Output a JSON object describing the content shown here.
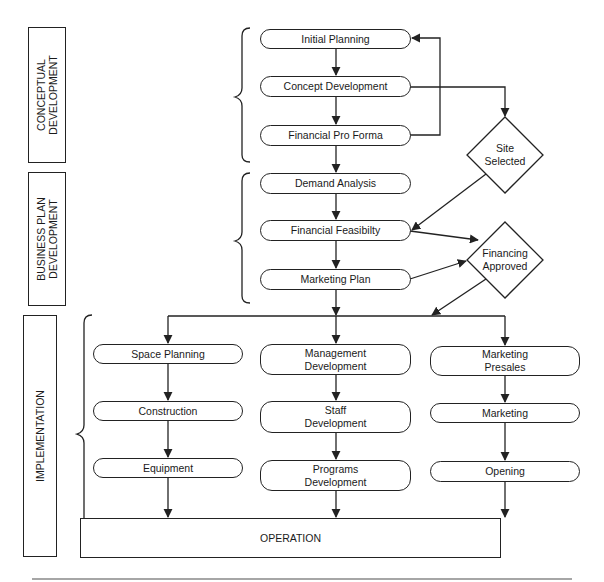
{
  "sections": [
    {
      "id": "conceptual",
      "label": "CONCEPTUAL\nDEVELOPMENT"
    },
    {
      "id": "business",
      "label": "BUSINESS PLAN\nDEVELOPMENT"
    },
    {
      "id": "implementation",
      "label": "IMPLEMENTATION"
    }
  ],
  "conceptual_steps": [
    "Initial Planning",
    "Concept Development",
    "Financial Pro Forma"
  ],
  "business_steps": [
    "Demand Analysis",
    "Financial Feasibilty",
    "Marketing Plan"
  ],
  "decisions": {
    "site": "Site\nSelected",
    "financing": "Financing\nApproved"
  },
  "implementation_columns": [
    {
      "steps": [
        "Space Planning",
        "Construction",
        "Equipment"
      ]
    },
    {
      "steps": [
        "Management\nDevelopment",
        "Staff\nDevelopment",
        "Programs\nDevelopment"
      ]
    },
    {
      "steps": [
        "Marketing\nPresales",
        "Marketing",
        "Opening"
      ]
    }
  ],
  "final": {
    "label": "OPERATION"
  },
  "colors": {
    "line": "#222222",
    "background": "#ffffff"
  }
}
